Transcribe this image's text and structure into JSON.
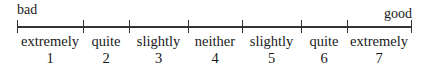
{
  "scale": {
    "left_anchor": "bad",
    "right_anchor": "good",
    "ticks_x": [
      17,
      83,
      129,
      188,
      242,
      301,
      347,
      411
    ],
    "points": [
      {
        "label": "extremely",
        "value": "1"
      },
      {
        "label": "quite",
        "value": "2"
      },
      {
        "label": "slightly",
        "value": "3"
      },
      {
        "label": "neither",
        "value": "4"
      },
      {
        "label": "slightly",
        "value": "5"
      },
      {
        "label": "quite",
        "value": "6"
      },
      {
        "label": "extremely",
        "value": "7"
      }
    ]
  }
}
